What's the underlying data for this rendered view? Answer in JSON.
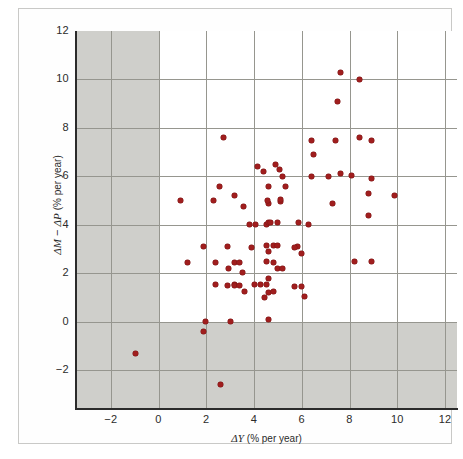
{
  "figure": {
    "background": "#ffffff",
    "frame_color": "#c9c9c7",
    "shade_color": "#cfcfcb",
    "grid_color": "#96968f",
    "marker_color": "#a01e1e"
  },
  "axes": {
    "x_label_delta": "Δ",
    "x_label_var": "Y",
    "x_label_unit": "(% per year)",
    "y_label_delta1": "Δ",
    "y_label_var1": "M",
    "y_label_minus": "−",
    "y_label_delta2": "Δ",
    "y_label_var2": "P",
    "y_label_unit": "(% per year)"
  },
  "chart_data": {
    "type": "scatter",
    "title": "",
    "xlabel": "ΔY (% per year)",
    "ylabel": "ΔM − ΔP (% per year)",
    "xlim": [
      -3.5,
      12.5
    ],
    "ylim": [
      -3.6,
      12.0
    ],
    "xticks": [
      -2,
      0,
      2,
      4,
      6,
      8,
      10,
      12
    ],
    "yticks": [
      -2,
      0,
      2,
      4,
      6,
      8,
      10,
      12
    ],
    "xtick_labels": [
      "−2",
      "0",
      "2",
      "4",
      "6",
      "8",
      "10",
      "12"
    ],
    "ytick_labels": [
      "−2",
      "0",
      "2",
      "4",
      "6",
      "8",
      "10",
      "12"
    ],
    "grid": true,
    "grid_spacing": 2,
    "legend": null,
    "shaded_regions": [
      {
        "name": "negative-x-band",
        "x_range": [
          -3.5,
          0
        ],
        "y_range": [
          -3.6,
          12.0
        ]
      },
      {
        "name": "negative-y-band",
        "x_range": [
          -3.5,
          12.5
        ],
        "y_range": [
          -3.6,
          0
        ]
      }
    ],
    "n_points": 86,
    "points": [
      [
        -0.95,
        -1.3
      ],
      [
        2.6,
        -2.6
      ],
      [
        1.95,
        0.0
      ],
      [
        3.0,
        0.0
      ],
      [
        1.9,
        -0.4
      ],
      [
        2.4,
        1.55
      ],
      [
        3.2,
        1.55
      ],
      [
        3.6,
        1.25
      ],
      [
        2.95,
        2.2
      ],
      [
        2.9,
        1.5
      ],
      [
        3.2,
        1.5
      ],
      [
        3.4,
        1.5
      ],
      [
        4.0,
        1.55
      ],
      [
        4.25,
        1.55
      ],
      [
        4.5,
        1.55
      ],
      [
        4.6,
        1.8
      ],
      [
        4.6,
        1.2
      ],
      [
        4.45,
        1.0
      ],
      [
        4.8,
        1.25
      ],
      [
        5.7,
        1.45
      ],
      [
        6.0,
        1.45
      ],
      [
        1.2,
        2.45
      ],
      [
        2.4,
        2.45
      ],
      [
        3.2,
        2.45
      ],
      [
        3.4,
        2.45
      ],
      [
        4.5,
        2.5
      ],
      [
        4.8,
        2.45
      ],
      [
        1.9,
        3.1
      ],
      [
        2.9,
        3.1
      ],
      [
        4.5,
        3.15
      ],
      [
        4.8,
        3.15
      ],
      [
        5.0,
        3.15
      ],
      [
        5.8,
        3.1
      ],
      [
        6.0,
        2.8
      ],
      [
        8.2,
        2.5
      ],
      [
        8.9,
        2.5
      ],
      [
        3.8,
        4.0
      ],
      [
        4.05,
        4.0
      ],
      [
        4.5,
        4.0
      ],
      [
        4.6,
        4.1
      ],
      [
        4.7,
        4.1
      ],
      [
        5.0,
        4.1
      ],
      [
        5.85,
        4.1
      ],
      [
        6.3,
        4.0
      ],
      [
        3.55,
        4.75
      ],
      [
        4.6,
        4.9
      ],
      [
        5.1,
        4.95
      ],
      [
        4.55,
        5.0
      ],
      [
        5.1,
        5.05
      ],
      [
        0.9,
        5.0
      ],
      [
        2.3,
        5.0
      ],
      [
        3.2,
        5.2
      ],
      [
        2.55,
        5.6
      ],
      [
        4.6,
        5.6
      ],
      [
        5.3,
        5.6
      ],
      [
        5.2,
        6.0
      ],
      [
        6.4,
        6.0
      ],
      [
        7.1,
        6.0
      ],
      [
        7.6,
        6.1
      ],
      [
        8.1,
        6.05
      ],
      [
        4.4,
        6.2
      ],
      [
        5.05,
        6.3
      ],
      [
        4.15,
        6.4
      ],
      [
        4.9,
        6.5
      ],
      [
        6.5,
        6.9
      ],
      [
        8.9,
        5.9
      ],
      [
        8.8,
        5.3
      ],
      [
        9.9,
        5.2
      ],
      [
        7.3,
        4.9
      ],
      [
        8.8,
        4.4
      ],
      [
        2.7,
        7.6
      ],
      [
        6.4,
        7.5
      ],
      [
        7.4,
        7.5
      ],
      [
        8.4,
        7.6
      ],
      [
        8.9,
        7.5
      ],
      [
        7.6,
        10.3
      ],
      [
        8.4,
        10.0
      ],
      [
        7.5,
        9.1
      ],
      [
        5.0,
        2.2
      ],
      [
        5.2,
        2.2
      ],
      [
        4.6,
        2.9
      ],
      [
        5.7,
        3.05
      ],
      [
        4.6,
        0.1
      ],
      [
        3.5,
        2.05
      ],
      [
        6.1,
        1.05
      ],
      [
        3.9,
        3.05
      ]
    ]
  }
}
